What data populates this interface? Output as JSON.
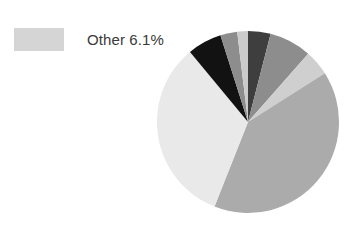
{
  "legend": {
    "items": [
      {
        "label": "Other 6.1%",
        "color": "#d5d5d5",
        "swatch_name": "legend-swatch-other"
      }
    ]
  },
  "chart_data": {
    "type": "pie",
    "title": "",
    "xlabel": "",
    "ylabel": "",
    "legend_position": "top-left",
    "grid": false,
    "start_angle_deg": 0,
    "direction": "clockwise",
    "center": {
      "x": 92,
      "y": 92
    },
    "radius": 91,
    "categories": [
      "Series 1",
      "Series 2",
      "Series 3",
      "Series 4",
      "Other",
      "Series 6",
      "Series 7",
      "Series 8"
    ],
    "labels": [
      "",
      "",
      "",
      "",
      "Other 6.1%",
      "",
      "",
      ""
    ],
    "values": [
      4.0,
      7.5,
      4.5,
      40.0,
      33.0,
      6.1,
      3.0,
      1.9
    ],
    "colors": [
      "#3e3e3e",
      "#8d8d8d",
      "#cfcfcf",
      "#ababab",
      "#e9e9e9",
      "#121212",
      "#8d8d8d",
      "#cbcbcb"
    ],
    "slices": [
      {
        "name": "slice-1",
        "value": 4.0,
        "color": "#3e3e3e",
        "start_deg": 0.0,
        "end_deg": 14.4
      },
      {
        "name": "slice-2",
        "value": 7.5,
        "color": "#8d8d8d",
        "start_deg": 14.4,
        "end_deg": 41.4
      },
      {
        "name": "slice-3",
        "value": 4.5,
        "color": "#cfcfcf",
        "start_deg": 41.4,
        "end_deg": 57.6
      },
      {
        "name": "slice-4",
        "value": 40.0,
        "color": "#ababab",
        "start_deg": 57.6,
        "end_deg": 201.6
      },
      {
        "name": "slice-5",
        "value": 33.0,
        "color": "#e9e9e9",
        "start_deg": 201.6,
        "end_deg": 320.4
      },
      {
        "name": "slice-6",
        "value": 6.1,
        "color": "#121212",
        "start_deg": 320.4,
        "end_deg": 342.36
      },
      {
        "name": "slice-7",
        "value": 3.0,
        "color": "#8d8d8d",
        "start_deg": 342.36,
        "end_deg": 353.16
      },
      {
        "name": "slice-8",
        "value": 1.9,
        "color": "#cbcbcb",
        "start_deg": 353.16,
        "end_deg": 360.0
      }
    ]
  }
}
